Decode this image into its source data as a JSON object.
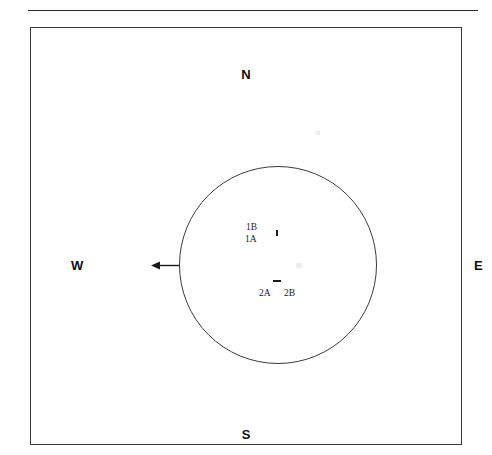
{
  "figure": {
    "type": "schematic-diagram"
  },
  "compass": {
    "north": "N",
    "east": "E",
    "south": "S",
    "west": "W"
  },
  "circle": {
    "center_x": 247,
    "center_y": 237,
    "radius": 99
  },
  "arrow": {
    "direction": "west",
    "tail_x": 148,
    "tip_x": 120,
    "y": 237
  },
  "labels": [
    {
      "id": "1B",
      "text": "1B",
      "x": 215,
      "y": 194
    },
    {
      "id": "1A",
      "text": "1A",
      "x": 214,
      "y": 206
    },
    {
      "id": "2A",
      "text": "2A",
      "x": 228,
      "y": 260
    },
    {
      "id": "2B",
      "text": "2B",
      "x": 253,
      "y": 260
    }
  ],
  "marks": [
    {
      "id": "mark-1",
      "x": 245,
      "y": 202,
      "orientation": "vertical"
    },
    {
      "id": "mark-2",
      "x": 242,
      "y": 252,
      "orientation": "horizontal"
    }
  ],
  "colors": {
    "stroke": "#3a3a3a",
    "rule": "#2b2b2b",
    "text": "#0f0f0f",
    "background": "#ffffff"
  }
}
